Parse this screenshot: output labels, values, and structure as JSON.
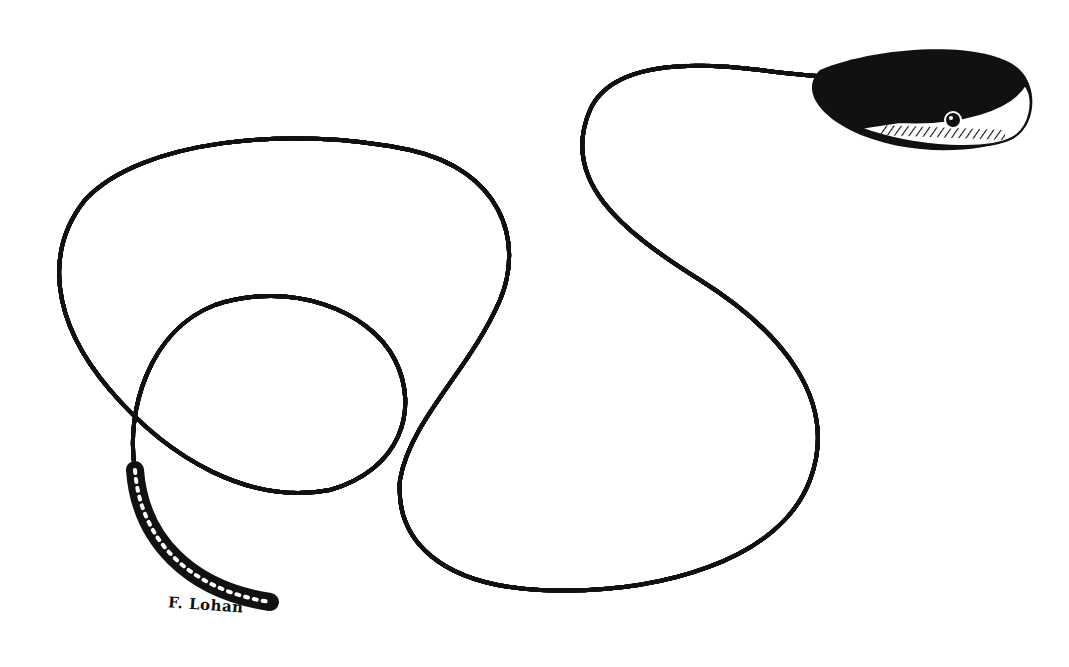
{
  "illustration": {
    "subject": "snake",
    "style": "pen-and-ink stipple and hatching drawing",
    "colors": {
      "ink": "#111111",
      "paper": "#ffffff"
    },
    "signature": "F. Lohan"
  }
}
